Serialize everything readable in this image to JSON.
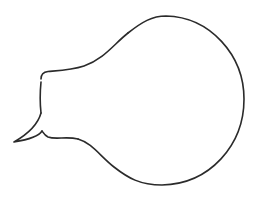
{
  "figure": {
    "type": "speech-bubble-outline",
    "stroke_color": "#2b2b2b",
    "fill_color": "#ffffff",
    "background": "#ffffff",
    "stroke_width": 1.6,
    "paths": {
      "upper_neck": "M 41 79 C 41 74, 43 72, 48 71.5 C 60 70.5, 72 70, 84 66 C 104 59, 114 44, 128 33",
      "bulb": "M 128 33 C 142 22, 152 16, 166 16 C 210 17, 244 55, 244 99 C 244 145, 210 184, 162 185 C 140 185, 128 178, 114 167 C 100 156, 92 143, 78 139",
      "lower_neck": "M 78 139 C 66 136, 56 140, 48 137 C 44 135, 43 132, 42 131",
      "tail": "M 42 131 C 39 136, 26 140, 14 142 C 28 134, 38 124, 41 113",
      "left_edge": "M 41 113 C 40 104, 40 92, 41 82"
    }
  }
}
